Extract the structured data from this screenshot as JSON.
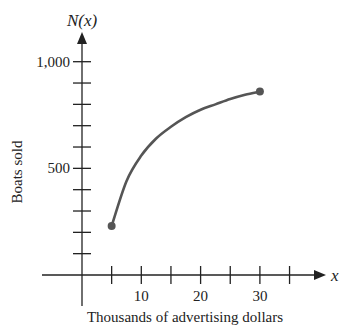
{
  "chart_data": {
    "type": "line",
    "title": "",
    "function_label": "N(x)",
    "xlabel": "Thousands of advertising dollars",
    "ylabel": "Boats sold",
    "x_axis_symbol": "x",
    "x_ticks": [
      5,
      10,
      15,
      20,
      25,
      30,
      35
    ],
    "x_tick_labels": [
      "10",
      "20",
      "30"
    ],
    "x_tick_label_values": [
      10,
      20,
      30
    ],
    "y_ticks": [
      100,
      200,
      300,
      400,
      500,
      600,
      700,
      800,
      900,
      1000
    ],
    "y_tick_labels": [
      "500",
      "1,000"
    ],
    "y_tick_label_values": [
      500,
      1000
    ],
    "xlim": [
      0,
      37
    ],
    "ylim": [
      0,
      1080
    ],
    "grid": false,
    "legend": null,
    "series": [
      {
        "name": "N(x)",
        "x": [
          5,
          7.5,
          10,
          12.5,
          15,
          17.5,
          20,
          22.5,
          25,
          27.5,
          30
        ],
        "values": [
          230,
          440,
          560,
          640,
          695,
          740,
          775,
          800,
          825,
          845,
          860
        ],
        "endpoints": [
          {
            "x": 5,
            "y": 230
          },
          {
            "x": 30,
            "y": 860
          }
        ]
      }
    ],
    "color": "#555555"
  }
}
